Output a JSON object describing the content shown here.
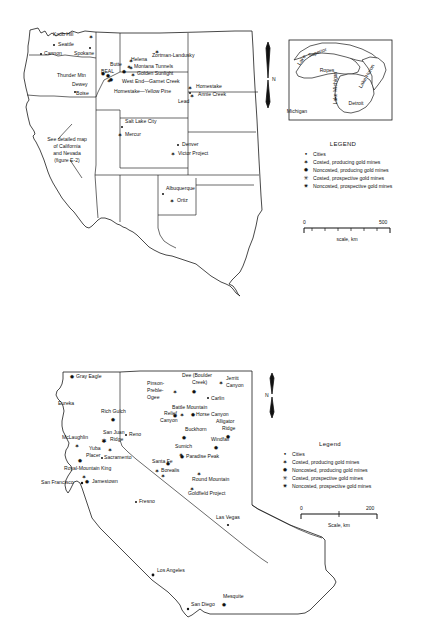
{
  "figure": {
    "title_note": "Gold mine location maps — Western United States and California/Nevada detail"
  },
  "top_map": {
    "note_lines": [
      "See detailed map",
      "of California",
      "and Nevada",
      "(figure E-2)"
    ],
    "north_label": "N",
    "scale": {
      "min": "0",
      "max": "500",
      "caption": "scale, km"
    },
    "legend": {
      "title": "LEGEND",
      "items": [
        {
          "symbol": "•",
          "label": "Cities"
        },
        {
          "symbol": "✶",
          "label": "Costed, producing gold mines"
        },
        {
          "symbol": "✹",
          "label": "Noncosted, producing gold mines"
        },
        {
          "symbol": "✳",
          "label": "Costed, prospective gold mines"
        },
        {
          "symbol": "✷",
          "label": "Noncosted, prospective gold mines"
        }
      ]
    },
    "labels": [
      {
        "name": "Knob Hill",
        "x": 53,
        "y": 36,
        "anchor": "start",
        "sym": "star",
        "sx": 91,
        "sy": 37
      },
      {
        "name": "Seattle",
        "x": 58,
        "y": 46,
        "anchor": "start",
        "sym": "dot",
        "sx": 54,
        "sy": 45
      },
      {
        "name": "Cannon",
        "x": 44,
        "y": 55,
        "anchor": "start",
        "sym": "dot",
        "sx": 41,
        "sy": 54
      },
      {
        "name": "Spokane",
        "x": 74,
        "y": 55,
        "anchor": "start",
        "sym": "dot",
        "sx": 90,
        "sy": 48
      },
      {
        "name": "Thunder Mtn",
        "x": 57,
        "y": 77,
        "anchor": "start",
        "sym": "star",
        "sx": 108,
        "sy": 76
      },
      {
        "name": "Dewey",
        "x": 72,
        "y": 86,
        "anchor": "start",
        "sym": "star",
        "sx": 109,
        "sy": 81
      },
      {
        "name": "Boise",
        "x": 76,
        "y": 95,
        "anchor": "start",
        "sym": "dot",
        "sx": 75,
        "sy": 92
      },
      {
        "name": "BEAL",
        "x": 101,
        "y": 73,
        "anchor": "start",
        "sym": "star",
        "sx": 124,
        "sy": 72
      },
      {
        "name": "Butte",
        "x": 110,
        "y": 66,
        "anchor": "start",
        "sym": "star",
        "sx": 129,
        "sy": 67
      },
      {
        "name": "Helena",
        "x": 131,
        "y": 61,
        "anchor": "start",
        "sym": "star",
        "sx": 131,
        "sy": 65
      },
      {
        "name": "Zortman-Landusky",
        "x": 152,
        "y": 57,
        "anchor": "start",
        "sym": "star",
        "sx": 157,
        "sy": 52
      },
      {
        "name": "Montana Tunnels",
        "x": 134,
        "y": 68,
        "anchor": "start",
        "sym": "star",
        "sx": 131,
        "sy": 68
      },
      {
        "name": "Golden Sunlight",
        "x": 137,
        "y": 75,
        "anchor": "start",
        "sym": "star",
        "sx": 133,
        "sy": 75
      },
      {
        "name": "West End—Garnet Creek",
        "x": 122,
        "y": 83,
        "anchor": "start",
        "sym": "star",
        "sx": 111,
        "sy": 80
      },
      {
        "name": "Homestake—Yellow Pine",
        "x": 114,
        "y": 93,
        "anchor": "start",
        "sym": "",
        "sx": 0,
        "sy": 0
      },
      {
        "name": "Homestake",
        "x": 196,
        "y": 88,
        "anchor": "start",
        "sym": "star",
        "sx": 190,
        "sy": 88
      },
      {
        "name": "Annie Creek",
        "x": 198,
        "y": 96,
        "anchor": "start",
        "sym": "star",
        "sx": 192,
        "sy": 96
      },
      {
        "name": "Lead",
        "x": 178,
        "y": 103,
        "anchor": "start",
        "sym": "dot",
        "sx": 190,
        "sy": 93
      },
      {
        "name": "Salt Lake City",
        "x": 125,
        "y": 123,
        "anchor": "start",
        "sym": "dot",
        "sx": 122,
        "sy": 127
      },
      {
        "name": "Mercur",
        "x": 125,
        "y": 136,
        "anchor": "start",
        "sym": "star",
        "sx": 120,
        "sy": 135
      },
      {
        "name": "Denver",
        "x": 182,
        "y": 146,
        "anchor": "start",
        "sym": "dot",
        "sx": 178,
        "sy": 145
      },
      {
        "name": "Victor Project",
        "x": 178,
        "y": 155,
        "anchor": "start",
        "sym": "star",
        "sx": 173,
        "sy": 154
      },
      {
        "name": "Albuquerque",
        "x": 166,
        "y": 190,
        "anchor": "start",
        "sym": "dot",
        "sx": 163,
        "sy": 194
      },
      {
        "name": "Ortiz",
        "x": 177,
        "y": 202,
        "anchor": "start",
        "sym": "star",
        "sx": 172,
        "sy": 201
      }
    ]
  },
  "inset_map": {
    "labels": [
      {
        "name": "Lake",
        "x": 303,
        "y": 61,
        "rot": -55
      },
      {
        "name": "Superior",
        "x": 318,
        "y": 54,
        "rot": -20
      },
      {
        "name": "Ropes",
        "x": 327,
        "y": 72,
        "rot": 0
      },
      {
        "name": "Lake Michigan",
        "x": 337,
        "y": 88,
        "rot": -90
      },
      {
        "name": "Lake Huron",
        "x": 368,
        "y": 77,
        "rot": -60
      },
      {
        "name": "Detroit",
        "x": 356,
        "y": 105,
        "rot": 0
      },
      {
        "name": "Michigan",
        "x": 297,
        "y": 113,
        "rot": 0
      }
    ]
  },
  "bottom_map": {
    "north_label": "N",
    "scale": {
      "min": "0",
      "max": "200",
      "caption": "Scale, km"
    },
    "legend": {
      "title": "Legend",
      "items": [
        {
          "symbol": "•",
          "label": "Cities"
        },
        {
          "symbol": "✶",
          "label": "Costed, producing gold mines"
        },
        {
          "symbol": "✹",
          "label": "Noncosted, producing gold mines"
        },
        {
          "symbol": "✳",
          "label": "Costed, prospective gold mines"
        },
        {
          "symbol": "✷",
          "label": "Noncosted, prospective gold mines"
        }
      ]
    },
    "labels": [
      {
        "name": "Gray Eagle",
        "x": 76,
        "y": 378,
        "anchor": "start",
        "sym": "star",
        "sx": 72,
        "sy": 377
      },
      {
        "name": "Eureka",
        "x": 58,
        "y": 405,
        "anchor": "start",
        "sym": "",
        "sx": 0,
        "sy": 0
      },
      {
        "name": "Rich Gulch",
        "x": 101,
        "y": 413,
        "anchor": "start",
        "sym": "star",
        "sx": 113,
        "sy": 420
      },
      {
        "name": "McLaughlin",
        "x": 62,
        "y": 439,
        "anchor": "start",
        "sym": "star",
        "sx": 77,
        "sy": 446
      },
      {
        "name": "San Juan",
        "x": 103,
        "y": 434,
        "anchor": "start",
        "sym": "star",
        "sx": 104,
        "sy": 441
      },
      {
        "name": "Ridge",
        "x": 110,
        "y": 441,
        "anchor": "start",
        "sym": "",
        "sx": 0,
        "sy": 0
      },
      {
        "name": "Yuba",
        "x": 89,
        "y": 450,
        "anchor": "start",
        "sym": "star",
        "sx": 110,
        "sy": 450
      },
      {
        "name": "Placer",
        "x": 86,
        "y": 457,
        "anchor": "start",
        "sym": "star",
        "sx": 80,
        "sy": 461
      },
      {
        "name": "Sacramento",
        "x": 104,
        "y": 459,
        "anchor": "start",
        "sym": "dot",
        "sx": 102,
        "sy": 458
      },
      {
        "name": "Royal-Mountain King",
        "x": 64,
        "y": 470,
        "anchor": "start",
        "sym": "star",
        "sx": 84,
        "sy": 477
      },
      {
        "name": "Jamestown",
        "x": 92,
        "y": 483,
        "anchor": "start",
        "sym": "star",
        "sx": 87,
        "sy": 482
      },
      {
        "name": "San Francisco",
        "x": 41,
        "y": 484,
        "anchor": "start",
        "sym": "dot",
        "sx": 82,
        "sy": 483
      },
      {
        "name": "Fresno",
        "x": 139,
        "y": 503,
        "anchor": "start",
        "sym": "dot",
        "sx": 136,
        "sy": 502
      },
      {
        "name": "Los Angeles",
        "x": 157,
        "y": 572,
        "anchor": "start",
        "sym": "dot",
        "sx": 153,
        "sy": 575
      },
      {
        "name": "San Diego",
        "x": 191,
        "y": 606,
        "anchor": "start",
        "sym": "dot",
        "sx": 188,
        "sy": 609
      },
      {
        "name": "Mesquite",
        "x": 223,
        "y": 598,
        "anchor": "start",
        "sym": "star",
        "sx": 224,
        "sy": 605
      },
      {
        "name": "Reno",
        "x": 129,
        "y": 436,
        "anchor": "start",
        "sym": "dot",
        "sx": 126,
        "sy": 435
      },
      {
        "name": "Las Vegas",
        "x": 216,
        "y": 519,
        "anchor": "start",
        "sym": "dot",
        "sx": 228,
        "sy": 525
      },
      {
        "name": "Pinson-",
        "x": 147,
        "y": 385,
        "anchor": "start",
        "sym": "star",
        "sx": 175,
        "sy": 392
      },
      {
        "name": "Preble-",
        "x": 147,
        "y": 392,
        "anchor": "start",
        "sym": "",
        "sx": 0,
        "sy": 0
      },
      {
        "name": "Ogee",
        "x": 147,
        "y": 399,
        "anchor": "start",
        "sym": "",
        "sx": 0,
        "sy": 0
      },
      {
        "name": "Dee (Boulder",
        "x": 182,
        "y": 377,
        "anchor": "start",
        "sym": "star",
        "sx": 194,
        "sy": 392
      },
      {
        "name": "Creek)",
        "x": 192,
        "y": 384,
        "anchor": "start",
        "sym": "",
        "sx": 0,
        "sy": 0
      },
      {
        "name": "Jerritt",
        "x": 226,
        "y": 380,
        "anchor": "start",
        "sym": "star",
        "sx": 221,
        "sy": 383
      },
      {
        "name": "Canyon",
        "x": 226,
        "y": 387,
        "anchor": "start",
        "sym": "",
        "sx": 0,
        "sy": 0
      },
      {
        "name": "Carlin",
        "x": 211,
        "y": 400,
        "anchor": "start",
        "sym": "dot",
        "sx": 208,
        "sy": 398
      },
      {
        "name": "Battle Mountain",
        "x": 172,
        "y": 409,
        "anchor": "start",
        "sym": "star",
        "sx": 182,
        "sy": 415
      },
      {
        "name": "Relief",
        "x": 164,
        "y": 415,
        "anchor": "start",
        "sym": "star",
        "sx": 175,
        "sy": 416
      },
      {
        "name": "Canyon",
        "x": 160,
        "y": 422,
        "anchor": "start",
        "sym": "",
        "sx": 0,
        "sy": 0
      },
      {
        "name": "Horse Canyon",
        "x": 196,
        "y": 416,
        "anchor": "start",
        "sym": "star",
        "sx": 193,
        "sy": 415
      },
      {
        "name": "Alligator",
        "x": 216,
        "y": 423,
        "anchor": "start",
        "sym": "star",
        "sx": 228,
        "sy": 437
      },
      {
        "name": "Ridge",
        "x": 222,
        "y": 430,
        "anchor": "start",
        "sym": "",
        "sx": 0,
        "sy": 0
      },
      {
        "name": "Buckhorn",
        "x": 185,
        "y": 431,
        "anchor": "start",
        "sym": "star",
        "sx": 184,
        "sy": 438
      },
      {
        "name": "Windfall",
        "x": 211,
        "y": 441,
        "anchor": "start",
        "sym": "star",
        "sx": 216,
        "sy": 448
      },
      {
        "name": "Sumich",
        "x": 175,
        "y": 448,
        "anchor": "start",
        "sym": "star",
        "sx": 181,
        "sy": 455
      },
      {
        "name": "Paradise Peak",
        "x": 186,
        "y": 458,
        "anchor": "start",
        "sym": "star",
        "sx": 182,
        "sy": 457
      },
      {
        "name": "Santa Fe",
        "x": 152,
        "y": 463,
        "anchor": "start",
        "sym": "star",
        "sx": 168,
        "sy": 464
      },
      {
        "name": "Borealis",
        "x": 161,
        "y": 472,
        "anchor": "start",
        "sym": "star",
        "sx": 157,
        "sy": 471
      },
      {
        "name": "Round Mountain",
        "x": 192,
        "y": 481,
        "anchor": "start",
        "sym": "star",
        "sx": 199,
        "sy": 474
      },
      {
        "name": "Goldfield Project",
        "x": 188,
        "y": 495,
        "anchor": "start",
        "sym": "star",
        "sx": 192,
        "sy": 489
      }
    ]
  }
}
